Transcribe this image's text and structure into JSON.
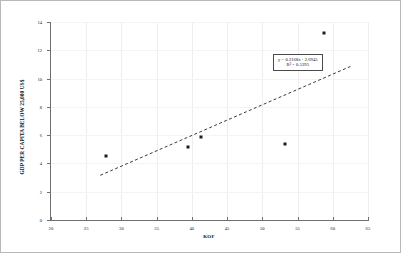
{
  "chart_data": {
    "type": "scatter",
    "title": "",
    "xlabel": "KOF",
    "ylabel": "GDP PER CAPITA BELOW 25,000 US$",
    "xlim": [
      20,
      65
    ],
    "ylim": [
      0,
      14
    ],
    "xticks": [
      20,
      25,
      30,
      35,
      40,
      45,
      50,
      55,
      60,
      65
    ],
    "yticks": [
      0,
      2,
      4,
      6,
      8,
      10,
      12,
      14
    ],
    "grid": true,
    "legend": "none",
    "points": [
      {
        "x": 27.8,
        "y": 4.5
      },
      {
        "x": 39.5,
        "y": 5.15
      },
      {
        "x": 41.3,
        "y": 5.85
      },
      {
        "x": 53.2,
        "y": 5.4
      },
      {
        "x": 58.8,
        "y": 13.2
      }
    ],
    "series": [
      {
        "name": "GDP per capita below 25,000 US$",
        "x": [
          27.8,
          39.5,
          41.3,
          53.2,
          58.8
        ],
        "values": [
          4.5,
          5.15,
          5.85,
          5.4,
          13.2
        ]
      }
    ],
    "trendline": {
      "type": "linear",
      "style": "dashed",
      "slope": 0.2168,
      "intercept": -2.6945,
      "r_squared": 0.5395,
      "x_start": 27.0,
      "x_end": 62.5,
      "equation_text": "y = 0.2168x - 2.6945",
      "r2_text": "R² = 0.5395"
    },
    "annotations": [
      {
        "name": "equation-box",
        "line1": "y = 0.2168x - 2.6945",
        "line2": "R² = 0.5395"
      }
    ],
    "colors": {
      "point": "#1c1c1c",
      "trendline": "#3a3a3a",
      "axis": "#6f6f6f",
      "grid": "#eeeeee",
      "border": "#b8b8b8",
      "text": "#111111",
      "background": "#ffffff"
    }
  }
}
